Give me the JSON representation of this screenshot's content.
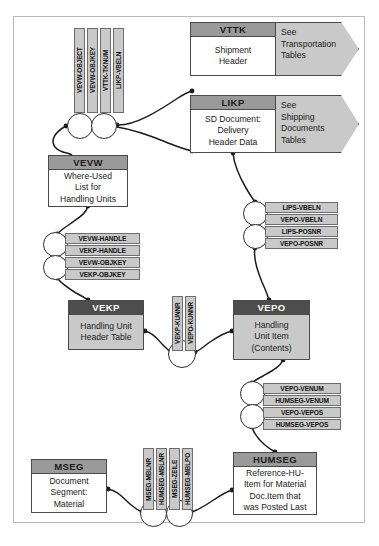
{
  "diagram": {
    "frame": {
      "border_color": "#b9b9b9"
    },
    "entities": [
      {
        "id": "vttk",
        "name": "VTTK",
        "description_lines": [
          "Shipment",
          "Header"
        ],
        "header_style": "gray",
        "body_style": "white",
        "x": 190,
        "y": 22,
        "w": 86,
        "h": 54,
        "header_h": 14
      },
      {
        "id": "likp",
        "name": "LIKP",
        "description_lines": [
          "SD Document:",
          "Delivery",
          "Header Data"
        ],
        "header_style": "gray",
        "body_style": "white",
        "x": 190,
        "y": 95,
        "w": 86,
        "h": 58,
        "header_h": 14
      },
      {
        "id": "vevw",
        "name": "VEVW",
        "description_lines": [
          "Where-Used",
          "List for",
          "Handling Units"
        ],
        "header_style": "gray",
        "body_style": "white",
        "x": 48,
        "y": 155,
        "w": 80,
        "h": 52,
        "header_h": 14
      },
      {
        "id": "vekp",
        "name": "VEKP",
        "description_lines": [
          "Handling Unit",
          "Header Table"
        ],
        "header_style": "dark",
        "body_style": "gray",
        "x": 68,
        "y": 300,
        "w": 76,
        "h": 50,
        "header_h": 14
      },
      {
        "id": "vepo",
        "name": "VEPO",
        "description_lines": [
          "Handling",
          "Unit Item",
          "(Contents)"
        ],
        "header_style": "dark",
        "body_style": "gray",
        "x": 233,
        "y": 300,
        "w": 77,
        "h": 60,
        "header_h": 14
      },
      {
        "id": "humseg",
        "name": "HUMSEG",
        "description_lines": [
          "Reference-HU-",
          "Item for Material",
          "Doc.Item that",
          "was Posted Last"
        ],
        "header_style": "gray",
        "body_style": "white",
        "x": 233,
        "y": 452,
        "w": 84,
        "h": 63,
        "header_h": 14
      },
      {
        "id": "mseg",
        "name": "MSEG",
        "description_lines": [
          "Document",
          "Segment:",
          "Material"
        ],
        "header_style": "gray",
        "body_style": "white",
        "x": 31,
        "y": 459,
        "w": 76,
        "h": 54,
        "header_h": 14
      }
    ],
    "chevrons": [
      {
        "id": "transportation-tables",
        "lines": [
          "See",
          "Transportation",
          "Tables"
        ],
        "x": 276,
        "y": 22,
        "w": 83,
        "h": 54
      },
      {
        "id": "shipping-tables",
        "lines": [
          "See",
          "Shipping",
          "Documents",
          "Tables"
        ],
        "x": 276,
        "y": 95,
        "w": 83,
        "h": 58
      }
    ],
    "key_chips_vertical": [
      {
        "id": "vevw-object",
        "label": "VEVW-OBJECT",
        "x": 74,
        "y": 28,
        "w": 11,
        "h": 85
      },
      {
        "id": "vevw-objkey",
        "label": "VEVW-OBJKEY",
        "x": 87,
        "y": 28,
        "w": 11,
        "h": 85
      },
      {
        "id": "vttk-tknum",
        "label": "VTTK-TKNUM",
        "x": 100,
        "y": 28,
        "w": 11,
        "h": 85
      },
      {
        "id": "likp-vbeln",
        "label": "LIKP-VBELN",
        "x": 113,
        "y": 28,
        "w": 11,
        "h": 85
      },
      {
        "id": "vekp-kunnr",
        "label": "VEKP-KUNNR",
        "x": 172,
        "y": 296,
        "w": 11,
        "h": 55
      },
      {
        "id": "vepo-kunnr",
        "label": "VEPO-KUNNR",
        "x": 185,
        "y": 296,
        "w": 11,
        "h": 55
      },
      {
        "id": "mseg-mblnr",
        "label": "MSEG-MBLNR",
        "x": 143,
        "y": 448,
        "w": 11,
        "h": 62
      },
      {
        "id": "humseg-mblnr",
        "label": "HUMSEG-MBLNR",
        "x": 156,
        "y": 448,
        "w": 11,
        "h": 62
      },
      {
        "id": "mseg-zeile",
        "label": "MSEG-ZEILE",
        "x": 169,
        "y": 448,
        "w": 11,
        "h": 62
      },
      {
        "id": "humseg-mblpo",
        "label": "HUMSEG-MBLPO",
        "x": 182,
        "y": 448,
        "w": 11,
        "h": 62
      }
    ],
    "key_chips_horizontal": [
      {
        "id": "vevw-handle",
        "label": "VEVW-HANDLE",
        "x": 65,
        "y": 233,
        "w": 75,
        "h": 11
      },
      {
        "id": "vekp-handle",
        "label": "VEKP-HANDLE",
        "x": 65,
        "y": 245,
        "w": 75,
        "h": 11
      },
      {
        "id": "vevw-objkey-2",
        "label": "VEVW-OBJKEY",
        "x": 65,
        "y": 257,
        "w": 75,
        "h": 11
      },
      {
        "id": "vekp-objkey",
        "label": "VEKP-OBJKEY",
        "x": 65,
        "y": 269,
        "w": 75,
        "h": 11
      },
      {
        "id": "lips-vbeln",
        "label": "LIPS-VBELN",
        "x": 265,
        "y": 202,
        "w": 73,
        "h": 11
      },
      {
        "id": "vepo-vbeln",
        "label": "VEPO-VBELN",
        "x": 265,
        "y": 214,
        "w": 73,
        "h": 11
      },
      {
        "id": "lips-posnr",
        "label": "LIPS-POSNR",
        "x": 265,
        "y": 226,
        "w": 73,
        "h": 11
      },
      {
        "id": "vepo-posnr",
        "label": "VEPO-POSNR",
        "x": 265,
        "y": 238,
        "w": 73,
        "h": 11
      },
      {
        "id": "vepo-venum",
        "label": "VEPO-VENUM",
        "x": 263,
        "y": 383,
        "w": 78,
        "h": 11
      },
      {
        "id": "humseg-venum",
        "label": "HUMSEG-VENUM",
        "x": 263,
        "y": 395,
        "w": 78,
        "h": 11
      },
      {
        "id": "vepo-vepos",
        "label": "VEPO-VEPOS",
        "x": 263,
        "y": 407,
        "w": 78,
        "h": 11
      },
      {
        "id": "humseg-vepos",
        "label": "HUMSEG-VEPOS",
        "x": 263,
        "y": 419,
        "w": 78,
        "h": 11
      }
    ],
    "relationship_circles": [
      {
        "id": "rel-vevw-vttk",
        "x": 67,
        "y": 113,
        "d": 26
      },
      {
        "id": "rel-vevw-likp",
        "x": 91,
        "y": 113,
        "d": 26
      },
      {
        "id": "rel-vevw-handle",
        "x": 43,
        "y": 232,
        "d": 25
      },
      {
        "id": "rel-vevw-objkey",
        "x": 43,
        "y": 255,
        "d": 25
      },
      {
        "id": "rel-lips-vbeln",
        "x": 243,
        "y": 201,
        "d": 25
      },
      {
        "id": "rel-lips-posnr",
        "x": 243,
        "y": 224,
        "d": 25
      },
      {
        "id": "rel-vekp-vepo",
        "x": 168,
        "y": 340,
        "d": 28
      },
      {
        "id": "rel-vepo-venum",
        "x": 240,
        "y": 381,
        "d": 25
      },
      {
        "id": "rel-vepo-vepos",
        "x": 240,
        "y": 404,
        "d": 25
      },
      {
        "id": "rel-mseg-mblnr",
        "x": 140,
        "y": 500,
        "d": 27
      },
      {
        "id": "rel-mseg-zeile",
        "x": 166,
        "y": 500,
        "d": 27
      }
    ],
    "connector_color": "#1b1b1b"
  }
}
